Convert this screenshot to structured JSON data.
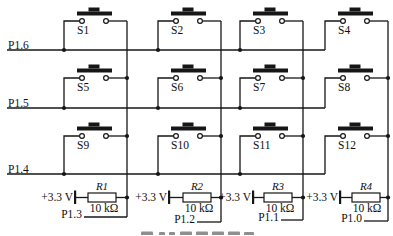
{
  "figure": {
    "rows": [
      {
        "label": "P1.6"
      },
      {
        "label": "P1.5"
      },
      {
        "label": "P1.4"
      }
    ],
    "switches": [
      {
        "label": "S1"
      },
      {
        "label": "S2"
      },
      {
        "label": "S3"
      },
      {
        "label": "S4"
      },
      {
        "label": "S5"
      },
      {
        "label": "S6"
      },
      {
        "label": "S7"
      },
      {
        "label": "S8"
      },
      {
        "label": "S9"
      },
      {
        "label": "S10"
      },
      {
        "label": "S11"
      },
      {
        "label": "S12"
      }
    ],
    "pullups": [
      {
        "supply": "+3.3 V",
        "name": "R1",
        "value": "10 kΩ",
        "pin": "P1.3"
      },
      {
        "supply": "+3.3 V",
        "name": "R2",
        "value": "10 kΩ",
        "pin": "P1.2"
      },
      {
        "supply": "+3.3 V",
        "name": "R3",
        "value": "10 kΩ",
        "pin": "P1.1"
      },
      {
        "supply": "+3.3 V",
        "name": "R4",
        "value": "10 kΩ",
        "pin": "P1.0"
      }
    ]
  }
}
